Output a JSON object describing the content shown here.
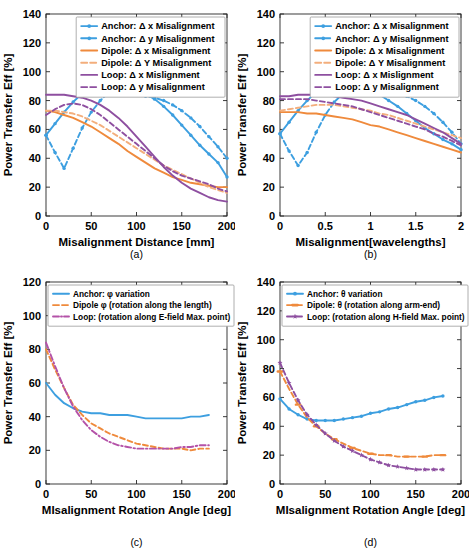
{
  "figure": {
    "ylabel": "Power Transfer Eff [%]",
    "panel_labels": {
      "a": "(a)",
      "b": "(b)",
      "c": "(c)",
      "d": "(d)"
    },
    "colors": {
      "anchor": "#3d9fe0",
      "dipole": "#ef8a3c",
      "dipole_light": "#f3ae7c",
      "loop": "#8e4fa0",
      "axis": "#262626"
    }
  },
  "chart_data": [
    {
      "id": "a",
      "type": "line",
      "title": "",
      "xlabel": "Misalignment Distance [mm]",
      "ylabel": "Power Transfer Eff [%]",
      "xlim": [
        0,
        200
      ],
      "ylim": [
        0,
        140
      ],
      "xticks": [
        0,
        50,
        100,
        150,
        200
      ],
      "yticks": [
        0,
        20,
        40,
        60,
        80,
        100,
        120,
        140
      ],
      "grid": false,
      "legend_position": "top-right",
      "series": [
        {
          "name": "Anchor: Δ x Misalignment",
          "color": "#3d9fe0",
          "style": "solid",
          "marker": "dot",
          "x": [
            0,
            10,
            20,
            30,
            40,
            50,
            60,
            70,
            80,
            90,
            100,
            110,
            120,
            130,
            140,
            150,
            160,
            170,
            180,
            190,
            200
          ],
          "y": [
            56,
            64,
            72,
            79,
            85,
            89,
            91,
            92,
            91,
            90,
            88,
            85,
            81,
            76,
            70,
            63,
            56,
            49,
            43,
            37,
            27
          ]
        },
        {
          "name": "Anchor: Δ y Misalignment",
          "color": "#3d9fe0",
          "style": "dashed",
          "marker": "dot",
          "x": [
            0,
            10,
            20,
            30,
            40,
            50,
            60,
            70,
            80,
            90,
            100,
            110,
            120,
            130,
            140,
            150,
            160,
            170,
            180,
            190,
            200
          ],
          "y": [
            56,
            44,
            33,
            47,
            61,
            72,
            80,
            86,
            85,
            84,
            84,
            83,
            82,
            80,
            77,
            73,
            68,
            62,
            55,
            48,
            40
          ]
        },
        {
          "name": "Dipole: Δ x Misalignment",
          "color": "#ef8a3c",
          "style": "solid",
          "marker": "none",
          "x": [
            0,
            10,
            20,
            30,
            40,
            50,
            60,
            70,
            80,
            90,
            100,
            110,
            120,
            130,
            140,
            150,
            160,
            170,
            180,
            190,
            200
          ],
          "y": [
            73,
            72,
            70,
            68,
            65,
            62,
            58,
            54,
            50,
            45,
            41,
            37,
            33,
            30,
            27,
            25,
            23,
            22,
            21,
            20,
            20
          ]
        },
        {
          "name": "Dipole: Δ Y Misalignment",
          "color": "#f3ae7c",
          "style": "dashed",
          "marker": "none",
          "x": [
            0,
            10,
            20,
            30,
            40,
            50,
            60,
            70,
            80,
            90,
            100,
            110,
            120,
            130,
            140,
            150,
            160,
            170,
            180,
            190,
            200
          ],
          "y": [
            73,
            73,
            72,
            71,
            69,
            66,
            63,
            59,
            55,
            51,
            47,
            43,
            39,
            35,
            32,
            29,
            26,
            23,
            20,
            18,
            16
          ]
        },
        {
          "name": "Loop: Δ x Mislignment",
          "color": "#8e4fa0",
          "style": "solid",
          "marker": "none",
          "x": [
            0,
            10,
            20,
            30,
            40,
            50,
            60,
            70,
            80,
            90,
            100,
            110,
            120,
            130,
            140,
            150,
            160,
            170,
            180,
            190,
            200
          ],
          "y": [
            84,
            84,
            84,
            83,
            82,
            80,
            77,
            73,
            68,
            62,
            55,
            48,
            41,
            34,
            28,
            23,
            19,
            16,
            13,
            11,
            10
          ]
        },
        {
          "name": "Loop: Δ y Misalignment",
          "color": "#8e4fa0",
          "style": "dashed",
          "marker": "none",
          "x": [
            0,
            10,
            20,
            30,
            40,
            50,
            60,
            70,
            80,
            90,
            100,
            110,
            120,
            130,
            140,
            150,
            160,
            170,
            180,
            190,
            200
          ],
          "y": [
            70,
            74,
            77,
            78,
            77,
            74,
            70,
            65,
            60,
            55,
            50,
            45,
            40,
            35,
            31,
            28,
            26,
            24,
            22,
            19,
            17
          ]
        }
      ]
    },
    {
      "id": "b",
      "type": "line",
      "title": "",
      "xlabel": "Misalignment[wavelengths]",
      "ylabel": "Power Transfer Eff [%]",
      "xlim": [
        0,
        2
      ],
      "ylim": [
        0,
        140
      ],
      "xticks": [
        0,
        0.5,
        1,
        1.5,
        2
      ],
      "yticks": [
        0,
        20,
        40,
        60,
        80,
        100,
        120,
        140
      ],
      "grid": false,
      "legend_position": "top-right",
      "series": [
        {
          "name": "Anchor: Δ x Misalignment",
          "color": "#3d9fe0",
          "style": "solid",
          "marker": "dot",
          "x": [
            0,
            0.1,
            0.2,
            0.3,
            0.4,
            0.5,
            0.6,
            0.7,
            0.8,
            0.9,
            1.0,
            1.1,
            1.2,
            1.3,
            1.4,
            1.5,
            1.6,
            1.7,
            1.8,
            1.9,
            2.0
          ],
          "y": [
            57,
            65,
            73,
            80,
            86,
            90,
            92,
            92,
            91,
            89,
            87,
            84,
            80,
            76,
            71,
            66,
            61,
            57,
            53,
            50,
            46
          ]
        },
        {
          "name": "Anchor: Δ y Misalignment",
          "color": "#3d9fe0",
          "style": "dashed",
          "marker": "dot",
          "x": [
            0,
            0.1,
            0.2,
            0.3,
            0.4,
            0.5,
            0.6,
            0.7,
            0.8,
            0.9,
            1.0,
            1.1,
            1.2,
            1.3,
            1.4,
            1.5,
            1.6,
            1.7,
            1.8,
            1.9,
            2.0
          ],
          "y": [
            57,
            45,
            35,
            44,
            58,
            70,
            79,
            85,
            86,
            86,
            87,
            87,
            86,
            85,
            83,
            80,
            76,
            71,
            65,
            58,
            50
          ]
        },
        {
          "name": "Dipole: Δ x Misalignment",
          "color": "#ef8a3c",
          "style": "solid",
          "marker": "none",
          "x": [
            0,
            0.1,
            0.2,
            0.3,
            0.4,
            0.5,
            0.6,
            0.7,
            0.8,
            0.9,
            1.0,
            1.1,
            1.2,
            1.3,
            1.4,
            1.5,
            1.6,
            1.7,
            1.8,
            1.9,
            2.0
          ],
          "y": [
            72,
            72,
            72,
            71,
            71,
            70,
            69,
            68,
            67,
            65,
            63,
            62,
            60,
            58,
            56,
            54,
            52,
            50,
            48,
            46,
            44
          ]
        },
        {
          "name": "Dipole: Δ Y Misalignment",
          "color": "#f3ae7c",
          "style": "dashed",
          "marker": "none",
          "x": [
            0,
            0.1,
            0.2,
            0.3,
            0.4,
            0.5,
            0.6,
            0.7,
            0.8,
            0.9,
            1.0,
            1.1,
            1.2,
            1.3,
            1.4,
            1.5,
            1.6,
            1.7,
            1.8,
            1.9,
            2.0
          ],
          "y": [
            73,
            74,
            75,
            76,
            77,
            77,
            77,
            76,
            75,
            74,
            73,
            71,
            70,
            68,
            66,
            64,
            62,
            60,
            58,
            56,
            54
          ]
        },
        {
          "name": "Loop: Δ x Mislignment",
          "color": "#8e4fa0",
          "style": "solid",
          "marker": "none",
          "x": [
            0,
            0.1,
            0.2,
            0.3,
            0.4,
            0.5,
            0.6,
            0.7,
            0.8,
            0.9,
            1.0,
            1.1,
            1.2,
            1.3,
            1.4,
            1.5,
            1.6,
            1.7,
            1.8,
            1.9,
            2.0
          ],
          "y": [
            83,
            83,
            84,
            84,
            84,
            84,
            83,
            82,
            81,
            80,
            78,
            76,
            74,
            72,
            70,
            67,
            64,
            61,
            58,
            54,
            50
          ]
        },
        {
          "name": "Loop: Δ y Misalignment",
          "color": "#8e4fa0",
          "style": "dashed",
          "marker": "none",
          "x": [
            0,
            0.1,
            0.2,
            0.3,
            0.4,
            0.5,
            0.6,
            0.7,
            0.8,
            0.9,
            1.0,
            1.1,
            1.2,
            1.3,
            1.4,
            1.5,
            1.6,
            1.7,
            1.8,
            1.9,
            2.0
          ],
          "y": [
            81,
            81,
            81,
            81,
            80,
            79,
            78,
            77,
            76,
            74,
            72,
            70,
            68,
            66,
            64,
            62,
            60,
            57,
            55,
            52,
            49
          ]
        }
      ]
    },
    {
      "id": "c",
      "type": "line",
      "title": "",
      "xlabel": "MIsalignment Rotation Angle [deg]",
      "ylabel": "Power Transfer Eff [%]",
      "xlim": [
        0,
        200
      ],
      "ylim": [
        0,
        120
      ],
      "xticks": [
        0,
        50,
        100,
        150,
        200
      ],
      "yticks": [
        0,
        20,
        40,
        60,
        80,
        100,
        120
      ],
      "grid": false,
      "legend_position": "top-left",
      "series": [
        {
          "name": "Anchor: φ variation",
          "color": "#3d9fe0",
          "style": "solid",
          "marker": "none",
          "x": [
            0,
            10,
            20,
            30,
            40,
            50,
            60,
            70,
            80,
            90,
            100,
            110,
            120,
            130,
            140,
            150,
            160,
            170,
            180
          ],
          "y": [
            60,
            53,
            48,
            45,
            43,
            42,
            42,
            41,
            41,
            41,
            40,
            39,
            39,
            39,
            39,
            39,
            40,
            40,
            41
          ]
        },
        {
          "name": "Dipole φ (rotation along the length)",
          "color": "#ef8a3c",
          "style": "dashed",
          "marker": "none",
          "x": [
            0,
            10,
            20,
            30,
            40,
            50,
            60,
            70,
            80,
            90,
            100,
            110,
            120,
            130,
            140,
            150,
            160,
            170,
            180
          ],
          "y": [
            80,
            68,
            57,
            47,
            41,
            36,
            33,
            30,
            28,
            26,
            24,
            23,
            22,
            21,
            21,
            21,
            20,
            21,
            21
          ]
        },
        {
          "name": "Loop: (rotation along E-field Max. point)",
          "color": "#b452a8",
          "style": "dashdot",
          "marker": "none",
          "x": [
            0,
            10,
            20,
            30,
            40,
            50,
            60,
            70,
            80,
            90,
            100,
            110,
            120,
            130,
            140,
            150,
            160,
            170,
            180
          ],
          "y": [
            84,
            70,
            57,
            46,
            38,
            32,
            28,
            25,
            23,
            22,
            21,
            21,
            21,
            21,
            21,
            22,
            22,
            23,
            23
          ]
        }
      ]
    },
    {
      "id": "d",
      "type": "line",
      "title": "",
      "xlabel": "MIsalignment Rotation Angle [deg]",
      "ylabel": "Power Transfer Eff [%]",
      "xlim": [
        0,
        200
      ],
      "ylim": [
        0,
        140
      ],
      "xticks": [
        0,
        50,
        100,
        150,
        200
      ],
      "yticks": [
        0,
        20,
        40,
        60,
        80,
        100,
        120,
        140
      ],
      "grid": false,
      "legend_position": "top-left",
      "series": [
        {
          "name": "Anchor: θ variation",
          "color": "#3d9fe0",
          "style": "solid",
          "marker": "dot",
          "x": [
            0,
            10,
            20,
            30,
            40,
            50,
            60,
            70,
            80,
            90,
            100,
            110,
            120,
            130,
            140,
            150,
            160,
            170,
            180
          ],
          "y": [
            59,
            52,
            48,
            45,
            44,
            44,
            44,
            45,
            46,
            47,
            49,
            50,
            52,
            53,
            55,
            57,
            58,
            60,
            61
          ]
        },
        {
          "name": "Dipole: θ (rotation along arm-end)",
          "color": "#ef8a3c",
          "style": "dashed",
          "marker": "dash",
          "x": [
            0,
            10,
            20,
            30,
            40,
            50,
            60,
            70,
            80,
            90,
            100,
            110,
            120,
            130,
            140,
            150,
            160,
            170,
            180
          ],
          "y": [
            78,
            66,
            55,
            46,
            40,
            35,
            31,
            28,
            25,
            23,
            21,
            20,
            20,
            19,
            19,
            19,
            19,
            20,
            20
          ]
        },
        {
          "name": "Loop: (rotation along H-field Max. point)",
          "color": "#8e4fa0",
          "style": "dashed",
          "marker": "star",
          "x": [
            0,
            10,
            20,
            30,
            40,
            50,
            60,
            70,
            80,
            90,
            100,
            110,
            120,
            130,
            140,
            150,
            160,
            170,
            180
          ],
          "y": [
            84,
            70,
            58,
            48,
            41,
            35,
            30,
            26,
            23,
            20,
            17,
            15,
            13,
            12,
            11,
            10,
            10,
            10,
            10
          ]
        }
      ]
    }
  ]
}
